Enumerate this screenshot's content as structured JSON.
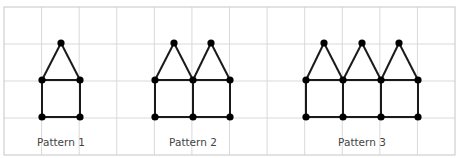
{
  "colors": {
    "grid": "#d9d9d9",
    "border": "#cfcfcf",
    "line": "#1a1a1a",
    "node": "#000000",
    "label": "#444444"
  },
  "grid": {
    "left": 4,
    "top": 7,
    "right": 455,
    "bottom": 155,
    "columns": 12,
    "rows": 4
  },
  "patterns": [
    {
      "label": "Pattern 1",
      "label_pos": [
        61,
        146
      ],
      "nodes": [
        [
          61,
          43
        ],
        [
          42,
          80
        ],
        [
          80,
          80
        ],
        [
          42,
          117
        ],
        [
          80,
          117
        ]
      ],
      "edges": [
        [
          0,
          1
        ],
        [
          0,
          2
        ],
        [
          1,
          2
        ],
        [
          1,
          3
        ],
        [
          2,
          4
        ],
        [
          3,
          4
        ]
      ]
    },
    {
      "label": "Pattern 2",
      "label_pos": [
        193,
        146
      ],
      "nodes": [
        [
          174,
          43
        ],
        [
          211,
          43
        ],
        [
          155,
          80
        ],
        [
          193,
          80
        ],
        [
          230,
          80
        ],
        [
          155,
          117
        ],
        [
          193,
          117
        ],
        [
          230,
          117
        ]
      ],
      "edges": [
        [
          0,
          2
        ],
        [
          0,
          3
        ],
        [
          1,
          3
        ],
        [
          1,
          4
        ],
        [
          2,
          3
        ],
        [
          3,
          4
        ],
        [
          2,
          5
        ],
        [
          3,
          6
        ],
        [
          4,
          7
        ],
        [
          5,
          6
        ],
        [
          6,
          7
        ]
      ]
    },
    {
      "label": "Pattern 3",
      "label_pos": [
        362,
        146
      ],
      "nodes": [
        [
          324,
          43
        ],
        [
          362,
          43
        ],
        [
          399,
          43
        ],
        [
          306,
          80
        ],
        [
          343,
          80
        ],
        [
          381,
          80
        ],
        [
          418,
          80
        ],
        [
          306,
          117
        ],
        [
          343,
          117
        ],
        [
          381,
          117
        ],
        [
          418,
          117
        ]
      ],
      "edges": [
        [
          0,
          3
        ],
        [
          0,
          4
        ],
        [
          1,
          4
        ],
        [
          1,
          5
        ],
        [
          2,
          5
        ],
        [
          2,
          6
        ],
        [
          3,
          4
        ],
        [
          4,
          5
        ],
        [
          5,
          6
        ],
        [
          3,
          7
        ],
        [
          4,
          8
        ],
        [
          5,
          9
        ],
        [
          6,
          10
        ],
        [
          7,
          8
        ],
        [
          8,
          9
        ],
        [
          9,
          10
        ]
      ]
    }
  ]
}
